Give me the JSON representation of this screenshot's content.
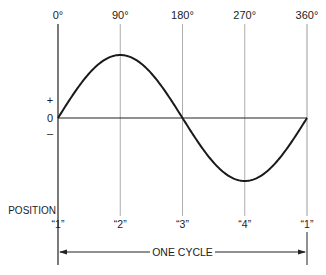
{
  "diagram": {
    "type": "sine-wave",
    "degree_labels": [
      "0°",
      "90°",
      "180°",
      "270°",
      "360°"
    ],
    "degree_values": [
      0,
      90,
      180,
      270,
      360
    ],
    "axis_labels": {
      "plus": "+",
      "zero": "0",
      "minus": "–"
    },
    "position_title": "POSITION",
    "position_labels": [
      "“1”",
      "“2”",
      "“3”",
      "“4”",
      "“1”"
    ],
    "cycle_label": "ONE CYCLE",
    "colors": {
      "curve": "#1a1a1a",
      "gridline": "#999999",
      "axis": "#222222"
    }
  }
}
